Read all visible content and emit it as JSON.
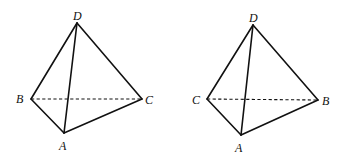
{
  "diagram": {
    "type": "geometry",
    "figures": [
      {
        "id": "left",
        "vertices": {
          "D": {
            "x": 77,
            "y": 23,
            "label": "D",
            "lx": 73,
            "ly": 20
          },
          "B": {
            "x": 31,
            "y": 99,
            "label": "B",
            "lx": 16,
            "ly": 103
          },
          "C": {
            "x": 142,
            "y": 99,
            "label": "C",
            "lx": 145,
            "ly": 104
          },
          "A": {
            "x": 64,
            "y": 133,
            "label": "A",
            "lx": 59,
            "ly": 150
          }
        },
        "solid_edges": [
          [
            "D",
            "B"
          ],
          [
            "D",
            "C"
          ],
          [
            "D",
            "A"
          ],
          [
            "B",
            "A"
          ],
          [
            "A",
            "C"
          ]
        ],
        "dashed_edges": [
          [
            "B",
            "C"
          ]
        ]
      },
      {
        "id": "right",
        "vertices": {
          "D": {
            "x": 253,
            "y": 25,
            "label": "D",
            "lx": 249,
            "ly": 22
          },
          "C": {
            "x": 207,
            "y": 99,
            "label": "C",
            "lx": 192,
            "ly": 104
          },
          "B": {
            "x": 318,
            "y": 100,
            "label": "B",
            "lx": 322,
            "ly": 105
          },
          "A": {
            "x": 241,
            "y": 135,
            "label": "A",
            "lx": 235,
            "ly": 152
          }
        },
        "solid_edges": [
          [
            "D",
            "C"
          ],
          [
            "D",
            "B"
          ],
          [
            "D",
            "A"
          ],
          [
            "C",
            "A"
          ],
          [
            "A",
            "B"
          ]
        ],
        "dashed_edges": [
          [
            "C",
            "B"
          ]
        ]
      }
    ],
    "colors": {
      "stroke": "#111111",
      "background": "#ffffff"
    }
  },
  "labels": {
    "left": {
      "D": "D",
      "B": "B",
      "C": "C",
      "A": "A"
    },
    "right": {
      "D": "D",
      "C": "C",
      "B": "B",
      "A": "A"
    }
  }
}
